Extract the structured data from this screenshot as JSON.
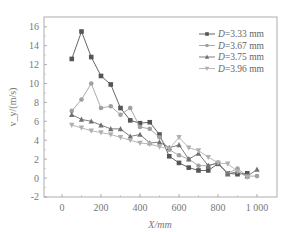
{
  "chart_data": {
    "type": "line",
    "title": "",
    "xlabel": "X/mm",
    "ylabel": "v_y/(m/s)",
    "xlim": [
      -80,
      1080
    ],
    "ylim": [
      -2,
      17
    ],
    "xticks": [
      0,
      200,
      400,
      600,
      800,
      1000
    ],
    "xtick_labels": [
      "0",
      "200",
      "400",
      "600",
      "800",
      "1 000"
    ],
    "yticks": [
      -2,
      0,
      2,
      4,
      6,
      8,
      10,
      12,
      14,
      16
    ],
    "ytick_labels": [
      "-2",
      "0",
      "2",
      "4",
      "6",
      "8",
      "10",
      "12",
      "14",
      "16"
    ],
    "grid": false,
    "legend_position": "upper right",
    "x": [
      50,
      100,
      150,
      200,
      250,
      300,
      350,
      400,
      450,
      500,
      550,
      600,
      650,
      700,
      750,
      800,
      850,
      900,
      950,
      1000
    ],
    "series": [
      {
        "name": "D=3.33 mm",
        "marker": "square",
        "color": "#555555",
        "values": [
          12.6,
          15.5,
          12.8,
          10.8,
          9.9,
          7.4,
          6.1,
          5.8,
          5.9,
          4.6,
          2.3,
          1.6,
          1.1,
          0.8,
          0.8,
          1.5,
          0.5,
          0.4,
          0.5,
          null
        ]
      },
      {
        "name": "D=3.67 mm",
        "marker": "circle",
        "color": "#a0a0a0",
        "values": [
          7.1,
          8.3,
          10.0,
          7.4,
          7.6,
          6.7,
          7.4,
          5.4,
          5.2,
          4.3,
          3.0,
          2.4,
          2.0,
          1.3,
          1.3,
          1.6,
          0.5,
          1.0,
          0.2,
          0.2
        ]
      },
      {
        "name": "D=3.75 mm",
        "marker": "triangle-up",
        "color": "#707070",
        "values": [
          6.7,
          6.2,
          6.0,
          5.6,
          5.2,
          5.2,
          4.4,
          4.6,
          3.7,
          3.8,
          3.2,
          3.5,
          2.0,
          2.6,
          1.3,
          1.6,
          0.4,
          0.7,
          0.2,
          0.9
        ]
      },
      {
        "name": "D=3.96 mm",
        "marker": "triangle-down",
        "color": "#b0b0b0",
        "values": [
          5.6,
          5.3,
          5.0,
          4.8,
          4.6,
          4.3,
          4.0,
          3.7,
          3.6,
          3.3,
          3.1,
          4.3,
          3.2,
          2.9,
          2.2,
          1.6,
          1.5,
          0.7,
          0.1,
          null
        ]
      }
    ]
  }
}
